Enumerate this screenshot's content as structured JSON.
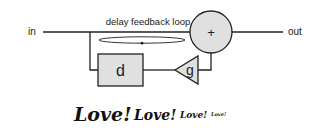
{
  "diagram": {
    "title": "delay feedback loop",
    "input_label": "in",
    "output_label": "out",
    "summer_symbol": "+",
    "delay_label": "d",
    "gain_label": "g",
    "colors": {
      "stroke": "#222222",
      "block_fill": "#e0e0e0",
      "background": "#ffffff"
    }
  },
  "caption": {
    "words": [
      "Love!",
      "Love!",
      "Love!",
      "Love!"
    ]
  }
}
